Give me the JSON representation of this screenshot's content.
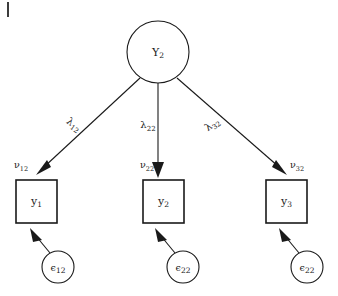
{
  "figure": {
    "type": "path-diagram",
    "title": "",
    "background_color": "#ffffff",
    "stroke_color": "#1a1a1a",
    "corner_tick": "|"
  },
  "latent": {
    "id": "eta2",
    "symbol": "Y",
    "subscript": "2",
    "shape": "circle",
    "cx": 158,
    "cy": 52,
    "r": 31
  },
  "indicators": [
    {
      "id": "y1",
      "symbol": "y",
      "subscript": "1",
      "shape": "rect",
      "x": 16,
      "y": 180,
      "width": 41,
      "height": 43
    },
    {
      "id": "y2",
      "symbol": "y",
      "subscript": "2",
      "shape": "rect",
      "x": 143,
      "y": 180,
      "width": 41,
      "height": 43
    },
    {
      "id": "y3",
      "symbol": "y",
      "subscript": "3",
      "shape": "rect",
      "x": 266,
      "y": 180,
      "width": 41,
      "height": 43
    }
  ],
  "residuals": [
    {
      "id": "eps12",
      "symbol": "ϵ",
      "subscript": "12",
      "shape": "circle",
      "cx": 58,
      "cy": 267,
      "r": 16
    },
    {
      "id": "eps22",
      "symbol": "ϵ",
      "subscript": "22",
      "shape": "circle",
      "cx": 183,
      "cy": 267,
      "r": 16
    },
    {
      "id": "eps32",
      "symbol": "ϵ",
      "subscript": "22",
      "shape": "circle",
      "cx": 307,
      "cy": 267,
      "r": 16
    }
  ],
  "loadings": [
    {
      "id": "lambda12",
      "symbol": "λ",
      "subscript": "12",
      "from": "eta2",
      "to": "y1",
      "label_x": 72,
      "label_y": 127,
      "rotation": 36
    },
    {
      "id": "lambda22",
      "symbol": "λ",
      "subscript": "22",
      "from": "eta2",
      "to": "y2",
      "label_x": 148,
      "label_y": 128,
      "rotation": 0
    },
    {
      "id": "lambda32",
      "symbol": "λ",
      "subscript": "32",
      "from": "eta2",
      "to": "y3",
      "label_x": 214,
      "label_y": 127,
      "rotation": -36
    }
  ],
  "intercepts": [
    {
      "id": "nu12",
      "symbol": "ν",
      "subscript": "12",
      "target": "y1",
      "label_x": 14,
      "label_y": 168,
      "anchor": "start"
    },
    {
      "id": "nu22",
      "symbol": "ν",
      "subscript": "22",
      "target": "y2",
      "label_x": 140,
      "label_y": 168,
      "anchor": "start"
    },
    {
      "id": "nu32",
      "symbol": "ν",
      "subscript": "32",
      "target": "y3",
      "label_x": 290,
      "label_y": 168,
      "anchor": "start"
    }
  ],
  "edges": [
    {
      "id": "edge-eta2-y1",
      "x1": 140,
      "y1": 78,
      "x2": 40,
      "y2": 171
    },
    {
      "id": "edge-eta2-y2",
      "x1": 158,
      "y1": 83,
      "x2": 158,
      "y2": 172
    },
    {
      "id": "edge-eta2-y3",
      "x1": 177,
      "y1": 78,
      "x2": 283,
      "y2": 171
    },
    {
      "id": "edge-eps12-y1",
      "x1": 50,
      "y1": 252,
      "x2": 35,
      "y2": 231
    },
    {
      "id": "edge-eps22-y2",
      "x1": 175,
      "y1": 252,
      "x2": 160,
      "y2": 231
    },
    {
      "id": "edge-eps32-y3",
      "x1": 299,
      "y1": 252,
      "x2": 284,
      "y2": 231
    }
  ]
}
